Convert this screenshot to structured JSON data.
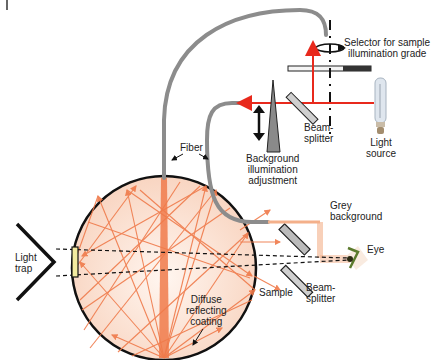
{
  "diagram": {
    "colors": {
      "laser_red": "#e8291c",
      "ray_orange": "#f07a4a",
      "sphere_fill": "#fbe3d6",
      "fiber_grey": "#8c8c8c",
      "outline": "#111111",
      "sample_yellow": "#f3eba0"
    },
    "labels": {
      "selector": [
        "Selector for sample",
        "illumination grade"
      ],
      "beam_splitter_top": [
        "Beam-",
        "splitter"
      ],
      "light_source": [
        "Light",
        "source"
      ],
      "background_adjust": [
        "Background",
        "illumination",
        "adjustment"
      ],
      "fiber": "Fiber",
      "grey_background": [
        "Grey",
        "background"
      ],
      "eye": "Eye",
      "light_trap": [
        "Light",
        "trap"
      ],
      "sample": "Sample",
      "beam_splitter_bottom": [
        "Beam-",
        "splitter"
      ],
      "coating": [
        "Diffuse",
        "reflecting",
        "coating"
      ]
    },
    "icons": [
      "light-bulb-icon",
      "eye-icon",
      "double-arrow-icon",
      "rotation-arrow-icon"
    ]
  }
}
